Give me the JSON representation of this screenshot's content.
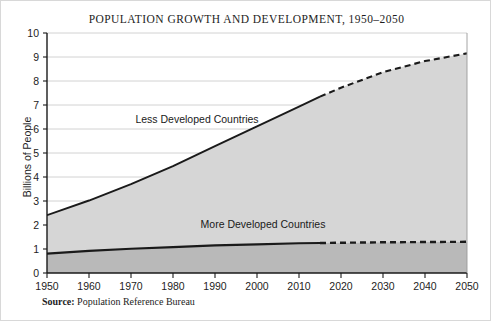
{
  "chart_data": {
    "type": "area",
    "title": "POPULATION GROWTH AND DEVELOPMENT, 1950–2050",
    "xlabel": "",
    "ylabel": "Billions of People",
    "xlim": [
      1950,
      2050
    ],
    "ylim": [
      0,
      10
    ],
    "grid": true,
    "legend_position": "inline-annotations",
    "stacked": true,
    "projection_start_year": 2015,
    "x_ticks": [
      1950,
      1960,
      1970,
      1980,
      1990,
      2000,
      2010,
      2020,
      2030,
      2040,
      2050
    ],
    "x_tick_labels": [
      "1950",
      "1960",
      "1970",
      "1980",
      "1990",
      "2000",
      "2010",
      "2020",
      "2030",
      "2040",
      "2050"
    ],
    "y_ticks": [
      0,
      1,
      2,
      3,
      4,
      5,
      6,
      7,
      8,
      9,
      10
    ],
    "y_tick_labels": [
      "0",
      "1",
      "2",
      "3",
      "4",
      "5",
      "6",
      "7",
      "8",
      "9",
      "10"
    ],
    "x": [
      1950,
      1960,
      1970,
      1980,
      1990,
      2000,
      2010,
      2015,
      2020,
      2030,
      2040,
      2050
    ],
    "series": [
      {
        "name": "More Developed Countries",
        "label": "More Developed Countries",
        "values": [
          0.81,
          0.92,
          1.01,
          1.08,
          1.15,
          1.19,
          1.24,
          1.25,
          1.26,
          1.28,
          1.29,
          1.3
        ],
        "color": "#1a1a1a",
        "fill_color": "#b9b9b9"
      },
      {
        "name": "Less Developed Countries",
        "label": "Less Developed Countries",
        "values": [
          2.41,
          3.02,
          3.7,
          4.45,
          5.29,
          6.11,
          6.93,
          7.35,
          7.72,
          8.37,
          8.83,
          9.15
        ],
        "color": "#1a1a1a",
        "fill_color": "#d6d6d6",
        "note": "plotted as cumulative total of both groups"
      }
    ]
  },
  "source": {
    "label": "Source:",
    "text": "Population Reference Bureau"
  }
}
